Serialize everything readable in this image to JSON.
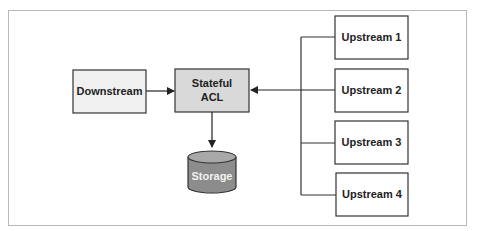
{
  "diagram": {
    "nodes": {
      "downstream": {
        "label": "Downstream",
        "fill": "#f0f0f0"
      },
      "acl": {
        "label_line1": "Stateful",
        "label_line2": "ACL",
        "fill": "#d9d9d9"
      },
      "storage": {
        "label": "Storage",
        "fill": "#8c8c8c",
        "top_fill": "#a8a8a8"
      },
      "upstreams": [
        {
          "label": "Upstream 1"
        },
        {
          "label": "Upstream 2"
        },
        {
          "label": "Upstream 3"
        },
        {
          "label": "Upstream 4"
        }
      ]
    },
    "edges": [
      {
        "from": "Downstream",
        "to": "Stateful ACL"
      },
      {
        "from": "Stateful ACL",
        "to": "Storage"
      },
      {
        "from": "Upstream 1-4 (bus)",
        "to": "Stateful ACL"
      }
    ],
    "colors": {
      "stroke": "#333333",
      "frame": "#b8b8b8"
    }
  }
}
